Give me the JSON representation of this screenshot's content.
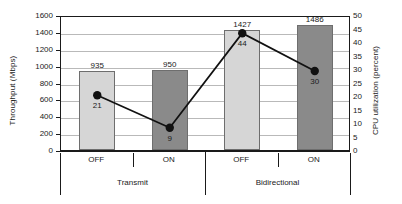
{
  "chart_data": {
    "type": "bar",
    "title": "",
    "xlabel": "",
    "ylabel": "Throughput (Mbps)",
    "y2label": "CPU utilization (percent)",
    "grid": true,
    "legend": "none",
    "ylim": [
      0,
      1600
    ],
    "y2lim": [
      0,
      50
    ],
    "yticks": [
      "1600",
      "1400",
      "1200",
      "1000",
      "800",
      "600",
      "400",
      "200",
      "0"
    ],
    "y2ticks": [
      "50",
      "45",
      "40",
      "35",
      "30",
      "25",
      "20",
      "15",
      "10",
      "5",
      "0"
    ],
    "categories": [
      "OFF",
      "ON",
      "OFF",
      "ON"
    ],
    "groups": [
      "Transmit",
      "Bidirectional"
    ],
    "series": [
      {
        "name": "Throughput (Mbps)",
        "type": "bar",
        "axis": "left",
        "values": [
          935,
          950,
          1427,
          1486
        ],
        "labels": [
          "935",
          "950",
          "1427",
          "1486"
        ],
        "colors": [
          "#d6d6d6",
          "#8a8a8a",
          "#d6d6d6",
          "#8a8a8a"
        ]
      },
      {
        "name": "CPU utilization (percent)",
        "type": "line",
        "axis": "right",
        "values": [
          21,
          9,
          44,
          30
        ],
        "labels": [
          "21",
          "9",
          "44",
          "30"
        ],
        "marker_color": "#111111",
        "line_color": "#111111"
      }
    ]
  },
  "axes": {
    "left_title": "Throughput (Mbps)",
    "right_title": "CPU utilization (percent)"
  }
}
